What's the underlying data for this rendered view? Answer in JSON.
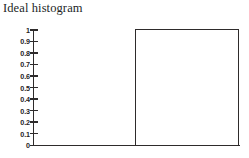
{
  "figure": {
    "title": "Ideal histogram",
    "background_color": "#ffffff",
    "ink_color": "#2e2b2b"
  },
  "chart_data": {
    "type": "bar",
    "title": "Ideal histogram",
    "xlabel": "",
    "ylabel": "",
    "grid": false,
    "legend": null,
    "axis": {
      "y_tick_labels": [
        "1",
        "0.9",
        "0.8",
        "0.7",
        "0.6",
        "0.5",
        "0.4",
        "0.3",
        "0.2",
        "0.1",
        "0"
      ],
      "y_tick_values": [
        1,
        0.9,
        0.8,
        0.7,
        0.6,
        0.5,
        0.4,
        0.3,
        0.2,
        0.1,
        0
      ],
      "ylim": [
        0,
        1
      ],
      "x_tick_labels": [],
      "x_axis_visible": true,
      "y_axis_visible": true
    },
    "bars": [
      {
        "label": "",
        "value": 1.0,
        "x_start_fraction": 0.492,
        "x_end_fraction": 0.995,
        "filled": false,
        "outline_color": "#2e2b2b"
      }
    ],
    "categories": [
      ""
    ],
    "values": [
      1.0
    ]
  }
}
